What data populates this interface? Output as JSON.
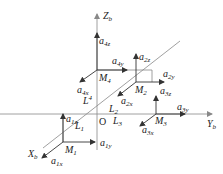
{
  "diagram": {
    "type": "3d-coordinate-frame",
    "axes": {
      "z": {
        "base": "Z",
        "sub": "b"
      },
      "y": {
        "base": "Y",
        "sub": "b"
      },
      "x": {
        "base": "X",
        "sub": "b"
      },
      "origin": "O"
    },
    "points": {
      "m1": {
        "base": "M",
        "sub": "1"
      },
      "m2": {
        "base": "M",
        "sub": "2"
      },
      "m3": {
        "base": "M",
        "sub": "3"
      },
      "m4": {
        "base": "M",
        "sub": "4"
      }
    },
    "lines": {
      "l1": {
        "base": "L",
        "sub": "1"
      },
      "l2": {
        "base": "L",
        "sub": "2"
      },
      "l3": {
        "base": "L",
        "sub": "3"
      },
      "l4": {
        "base": "L",
        "sup": "4"
      }
    },
    "vectors": {
      "a1x": {
        "base": "a",
        "sub": "1x"
      },
      "a1y": {
        "base": "a",
        "sub": "1y"
      },
      "a1z": {
        "base": "a",
        "sub": "1z"
      },
      "a2x": {
        "base": "a",
        "sub": "2x"
      },
      "a2y": {
        "base": "a",
        "sub": "2y"
      },
      "a2z": {
        "base": "a",
        "sub": "2z"
      },
      "a3x": {
        "base": "a",
        "sub": "3x"
      },
      "a3y": {
        "base": "a",
        "sub": "3y"
      },
      "a3z": {
        "base": "a",
        "sub": "3z"
      },
      "a4x": {
        "base": "a",
        "sub": "4x"
      },
      "a4y": {
        "base": "a",
        "sub": "4y"
      },
      "a4z": {
        "base": "a",
        "sub": "4z"
      }
    }
  }
}
